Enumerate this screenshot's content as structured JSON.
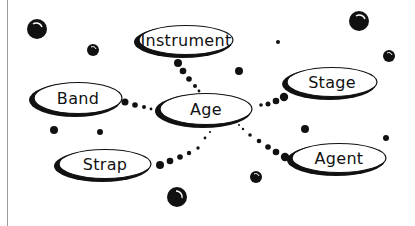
{
  "diagram": {
    "type": "mind-map",
    "center": {
      "id": "age",
      "label": "Age",
      "cx": 205,
      "cy": 109,
      "rx": 48,
      "ry": 17
    },
    "nodes": [
      {
        "id": "instrument",
        "label": "Instrument",
        "cx": 185,
        "cy": 40,
        "rx": 49,
        "ry": 16
      },
      {
        "id": "band",
        "label": "Band",
        "cx": 77,
        "cy": 98,
        "rx": 46,
        "ry": 17
      },
      {
        "id": "stage",
        "label": "Stage",
        "cx": 331,
        "cy": 82,
        "rx": 47,
        "ry": 16
      },
      {
        "id": "strap",
        "label": "Strap",
        "cx": 104,
        "cy": 164,
        "rx": 48,
        "ry": 16
      },
      {
        "id": "agent",
        "label": "Agent",
        "cx": 338,
        "cy": 158,
        "rx": 49,
        "ry": 16
      }
    ],
    "edges": [
      {
        "from": "age",
        "to": "instrument",
        "style": "dotted-beads"
      },
      {
        "from": "age",
        "to": "band",
        "style": "dotted-beads"
      },
      {
        "from": "age",
        "to": "stage",
        "style": "dotted-beads"
      },
      {
        "from": "age",
        "to": "strap",
        "style": "dotted-beads"
      },
      {
        "from": "age",
        "to": "agent",
        "style": "dotted-beads"
      }
    ],
    "colors": {
      "ink": "#111111",
      "background": "#ffffff",
      "rule": "#9a9a9a"
    }
  }
}
